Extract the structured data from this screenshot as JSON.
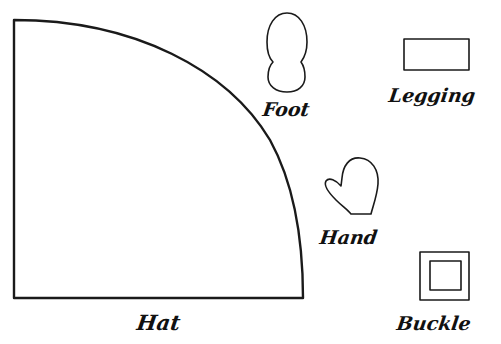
{
  "diagram": {
    "title": "",
    "pieces": [
      {
        "id": "hat",
        "label": "Hat",
        "shape": "quarter-circle"
      },
      {
        "id": "foot",
        "label": "Foot",
        "shape": "peanut-oval"
      },
      {
        "id": "legging",
        "label": "Legging",
        "shape": "rectangle"
      },
      {
        "id": "hand",
        "label": "Hand",
        "shape": "mitten"
      },
      {
        "id": "buckle",
        "label": "Buckle",
        "shape": "square-frame"
      }
    ],
    "colors": {
      "stroke": "#1a1a1a",
      "background": "#ffffff"
    }
  }
}
